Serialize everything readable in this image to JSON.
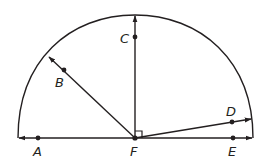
{
  "diagram": {
    "colors": {
      "stroke": "#231f20",
      "background": "#ffffff"
    },
    "center": {
      "label": "F",
      "x": 135,
      "y": 138
    },
    "points": [
      {
        "id": "A",
        "label": "A",
        "x": 38,
        "y": 138,
        "label_x": 33,
        "label_y": 156
      },
      {
        "id": "B",
        "label": "B",
        "x": 64,
        "y": 70,
        "label_x": 55,
        "label_y": 87
      },
      {
        "id": "C",
        "label": "C",
        "x": 135,
        "y": 37,
        "label_x": 120,
        "label_y": 43
      },
      {
        "id": "D",
        "label": "D",
        "x": 232,
        "y": 122,
        "label_x": 226,
        "label_y": 116
      },
      {
        "id": "E",
        "label": "E",
        "x": 233,
        "y": 138,
        "label_x": 228,
        "label_y": 156
      },
      {
        "id": "F",
        "label": "F",
        "x": 135,
        "y": 138,
        "label_x": 130,
        "label_y": 156
      }
    ],
    "rays": [
      {
        "name": "ray-FA",
        "from": "F",
        "through": "A"
      },
      {
        "name": "ray-FB",
        "from": "F",
        "through": "B"
      },
      {
        "name": "ray-FC",
        "from": "F",
        "through": "C"
      },
      {
        "name": "ray-FD",
        "from": "F",
        "through": "D"
      },
      {
        "name": "ray-FE",
        "from": "F",
        "through": "E"
      }
    ],
    "right_angle_marker": {
      "at": "F",
      "between": [
        "C",
        "E"
      ]
    }
  }
}
